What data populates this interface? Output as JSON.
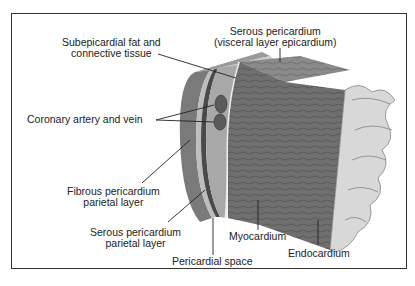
{
  "colors": {
    "border": "#333333",
    "myocardium": "#6f6f6f",
    "myocardium_top": "#8a8a8a",
    "endocardium": "#d8d8d8",
    "fibrous": "#7a7a7a",
    "serous_parietal": "#bdbdbd",
    "fat_layer": "#a8a8a8",
    "vessel": "#5a5a5a",
    "leader_line": "#222222"
  },
  "labels": {
    "subepicardial": {
      "line1": "Subepicardial fat and",
      "line2": "connective tissue"
    },
    "serous_visceral": {
      "line1": "Serous pericardium",
      "line2": "(visceral layer epicardium)"
    },
    "coronary": {
      "line1": "Coronary artery and vein"
    },
    "fibrous": {
      "line1": "Fibrous pericardium",
      "line2": "parietal layer"
    },
    "serous_parietal": {
      "line1": "Serous pericardium",
      "line2": "parietal layer"
    },
    "pericardial_space": {
      "line1": "Pericardial space"
    },
    "myocardium": {
      "line1": "Myocardium"
    },
    "endocardium": {
      "line1": "Endocardium"
    }
  }
}
